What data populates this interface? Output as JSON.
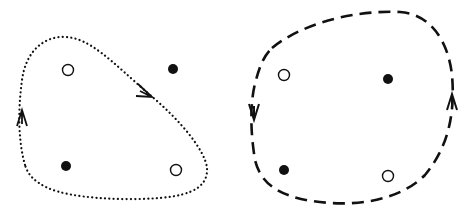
{
  "diagram": {
    "background": "#ffffff",
    "ink": "#111111",
    "panels": [
      {
        "id": "left",
        "loop_style": "dotted",
        "orientation": "clockwise",
        "points": [
          {
            "kind": "open",
            "x": 68,
            "y": 70,
            "enclosed": true
          },
          {
            "kind": "filled",
            "x": 173,
            "y": 69,
            "enclosed": false
          },
          {
            "kind": "filled",
            "x": 66,
            "y": 166,
            "enclosed": true
          },
          {
            "kind": "open",
            "x": 176,
            "y": 170,
            "enclosed": true
          }
        ],
        "arrows": [
          {
            "x": 22,
            "y": 119,
            "direction": "up"
          },
          {
            "x": 145,
            "y": 94,
            "direction": "down-right"
          }
        ]
      },
      {
        "id": "right",
        "loop_style": "dashed",
        "orientation": "counterclockwise",
        "points": [
          {
            "kind": "open",
            "x": 284,
            "y": 75,
            "enclosed": true
          },
          {
            "kind": "filled",
            "x": 388,
            "y": 79,
            "enclosed": true
          },
          {
            "kind": "filled",
            "x": 284,
            "y": 170,
            "enclosed": true
          },
          {
            "kind": "open",
            "x": 388,
            "y": 176,
            "enclosed": true
          }
        ],
        "arrows": [
          {
            "x": 254,
            "y": 110,
            "direction": "down"
          },
          {
            "x": 452,
            "y": 103,
            "direction": "up"
          }
        ]
      }
    ]
  }
}
